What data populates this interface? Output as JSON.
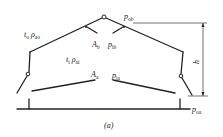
{
  "diagram": {
    "caption": "(a)",
    "labels": {
      "outside": {
        "t": "t",
        "t_sub": "o",
        "rho": "ρ",
        "rho_sub": "ao"
      },
      "inside": {
        "t": "t",
        "t_sub": "i",
        "rho": "ρ",
        "rho_sub": "ai"
      },
      "A_b": {
        "main": "A",
        "sub": "b"
      },
      "p_ib": {
        "main": "p",
        "sub": "ib"
      },
      "p_ob": {
        "main": "p",
        "sub": "ob"
      },
      "A_a": {
        "main": "A",
        "sub": "a"
      },
      "p_ia": {
        "main": "p",
        "sub": "ia"
      },
      "p_oa": {
        "main": "p",
        "sub": "oa"
      },
      "h": "h"
    }
  }
}
